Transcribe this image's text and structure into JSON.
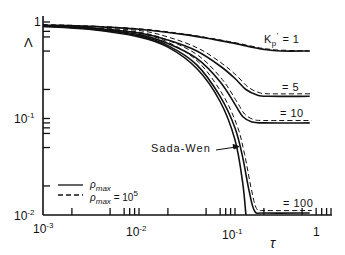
{
  "chart_data": {
    "type": "line",
    "title": "",
    "xlabel": "τ",
    "ylabel": "Λ",
    "xscale": "log",
    "yscale": "log",
    "xlim": [
      0.001,
      1
    ],
    "ylim": [
      0.01,
      1
    ],
    "x_ticks": [
      "10^-3",
      "10^-2",
      "10^-1",
      "1"
    ],
    "y_ticks": [
      "10^-2",
      "10^-1",
      "1"
    ],
    "grid": false,
    "legend": {
      "position": "lower left",
      "entries": [
        {
          "style": "solid",
          "label": "ρmax"
        },
        {
          "style": "dashed",
          "label": "ρmax = 10^5"
        }
      ]
    },
    "series": [
      {
        "name": "K'p = 1",
        "style": "solid",
        "x": [
          0.001,
          0.003,
          0.01,
          0.03,
          0.06,
          0.1,
          0.15,
          0.2,
          0.3,
          0.6
        ],
        "y": [
          0.93,
          0.9,
          0.84,
          0.74,
          0.66,
          0.6,
          0.55,
          0.52,
          0.5,
          0.5
        ]
      },
      {
        "name": "K'p = 1 (ρmax = 10^5)",
        "style": "dashed",
        "x": [
          0.001,
          0.003,
          0.01,
          0.03,
          0.06,
          0.1,
          0.15,
          0.2,
          0.3,
          0.6
        ],
        "y": [
          0.94,
          0.91,
          0.85,
          0.75,
          0.67,
          0.61,
          0.56,
          0.53,
          0.51,
          0.5
        ]
      },
      {
        "name": "K'p = 5",
        "style": "solid",
        "x": [
          0.001,
          0.003,
          0.01,
          0.02,
          0.04,
          0.07,
          0.1,
          0.13,
          0.17,
          0.22,
          0.6
        ],
        "y": [
          0.92,
          0.87,
          0.77,
          0.65,
          0.5,
          0.35,
          0.26,
          0.2,
          0.175,
          0.17,
          0.17
        ]
      },
      {
        "name": "K'p = 10",
        "style": "solid",
        "x": [
          0.001,
          0.003,
          0.01,
          0.02,
          0.04,
          0.07,
          0.1,
          0.12,
          0.15,
          0.2,
          0.6
        ],
        "y": [
          0.92,
          0.86,
          0.74,
          0.6,
          0.42,
          0.24,
          0.14,
          0.105,
          0.092,
          0.09,
          0.09
        ]
      },
      {
        "name": "K'p = 100",
        "style": "solid",
        "x": [
          0.001,
          0.003,
          0.01,
          0.02,
          0.04,
          0.07,
          0.1,
          0.12,
          0.14,
          0.16,
          0.2,
          0.6
        ],
        "y": [
          0.91,
          0.85,
          0.72,
          0.57,
          0.36,
          0.17,
          0.08,
          0.04,
          0.018,
          0.011,
          0.0105,
          0.0105
        ]
      },
      {
        "name": "Sada-Wen",
        "style": "solid",
        "x": [
          0.001,
          0.003,
          0.01,
          0.02,
          0.04,
          0.07,
          0.1,
          0.12,
          0.13
        ],
        "y": [
          0.9,
          0.84,
          0.7,
          0.55,
          0.33,
          0.15,
          0.06,
          0.022,
          0.01
        ]
      }
    ],
    "annotations": [
      "K'p = 1",
      "= 5",
      "= 10",
      "= 100",
      "Sada-Wen"
    ]
  },
  "labels": {
    "y_axis": "Λ",
    "x_axis": "τ",
    "y_tick_1": "1",
    "y_tick_01_base": "10",
    "y_tick_01_exp": "-1",
    "y_tick_001_base": "10",
    "y_tick_001_exp": "-2",
    "x_tick_0001_base": "10",
    "x_tick_0001_exp": "-3",
    "x_tick_001_base": "10",
    "x_tick_001_exp": "-2",
    "x_tick_01_base": "10",
    "x_tick_01_exp": "-1",
    "x_tick_1": "1",
    "k1": "K",
    "k1_sub": "p",
    "k1_sup": "'",
    "k1_val": "= 1",
    "k5": "= 5",
    "k10": "= 10",
    "k100": "= 100",
    "sada_wen": "Sada-Wen",
    "legend_solid_base": "ρ",
    "legend_solid_sub": "max",
    "legend_dashed_base": "ρ",
    "legend_dashed_sub": "max",
    "legend_dashed_eq": " =  10",
    "legend_dashed_exp": "5"
  }
}
